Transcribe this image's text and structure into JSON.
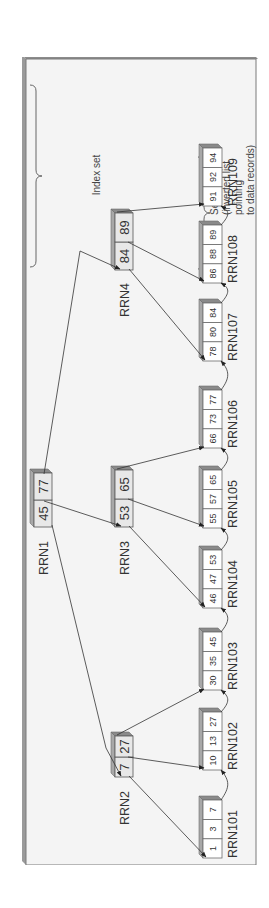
{
  "figure": {
    "orientation": "rotated-90-ccw",
    "labels": {
      "index_set": "Index set",
      "sequence_set_lines": [
        "Sequence set",
        "(inverted list",
        "pointing",
        "to data records)"
      ]
    },
    "index_nodes": [
      {
        "id": "RRN1",
        "label": "RRN1",
        "keys": [
          "45",
          "77"
        ],
        "level": "root"
      },
      {
        "id": "RRN2",
        "label": "RRN2",
        "keys": [
          "7",
          "27"
        ],
        "level": "internal"
      },
      {
        "id": "RRN3",
        "label": "RRN3",
        "keys": [
          "53",
          "65"
        ],
        "level": "internal"
      },
      {
        "id": "RRN4",
        "label": "RRN4",
        "keys": [
          "84",
          "89"
        ],
        "level": "internal"
      }
    ],
    "sequence_nodes": [
      {
        "id": "RRN101",
        "label": "RRN101",
        "keys": [
          "1",
          "3",
          "7"
        ]
      },
      {
        "id": "RRN102",
        "label": "RRN102",
        "keys": [
          "10",
          "13",
          "27"
        ]
      },
      {
        "id": "RRN103",
        "label": "RRN103",
        "keys": [
          "30",
          "35",
          "45"
        ]
      },
      {
        "id": "RRN104",
        "label": "RRN104",
        "keys": [
          "46",
          "47",
          "53"
        ]
      },
      {
        "id": "RRN105",
        "label": "RRN105",
        "keys": [
          "55",
          "57",
          "65"
        ]
      },
      {
        "id": "RRN106",
        "label": "RRN106",
        "keys": [
          "66",
          "73",
          "77"
        ]
      },
      {
        "id": "RRN107",
        "label": "RRN107",
        "keys": [
          "78",
          "80",
          "84"
        ]
      },
      {
        "id": "RRN108",
        "label": "RRN108",
        "keys": [
          "86",
          "88",
          "89"
        ]
      },
      {
        "id": "RRN109",
        "label": "RRN109",
        "keys": [
          "91",
          "92",
          "94"
        ]
      }
    ],
    "pointers": [
      {
        "from": "RRN1",
        "to": "RRN2"
      },
      {
        "from": "RRN1",
        "to": "RRN3"
      },
      {
        "from": "RRN1",
        "to": "RRN4"
      },
      {
        "from": "RRN2",
        "to": "RRN101"
      },
      {
        "from": "RRN2",
        "to": "RRN102"
      },
      {
        "from": "RRN2",
        "to": "RRN103"
      },
      {
        "from": "RRN3",
        "to": "RRN104"
      },
      {
        "from": "RRN3",
        "to": "RRN105"
      },
      {
        "from": "RRN3",
        "to": "RRN106"
      },
      {
        "from": "RRN4",
        "to": "RRN107"
      },
      {
        "from": "RRN4",
        "to": "RRN108"
      },
      {
        "from": "RRN4",
        "to": "RRN109"
      }
    ],
    "colors": {
      "frame_face": "#f4f4f4",
      "frame_edge": "#8c8c8c",
      "cell_fill": "#ffffff",
      "box_shade": "#8a8a8a",
      "line": "#333333"
    }
  }
}
